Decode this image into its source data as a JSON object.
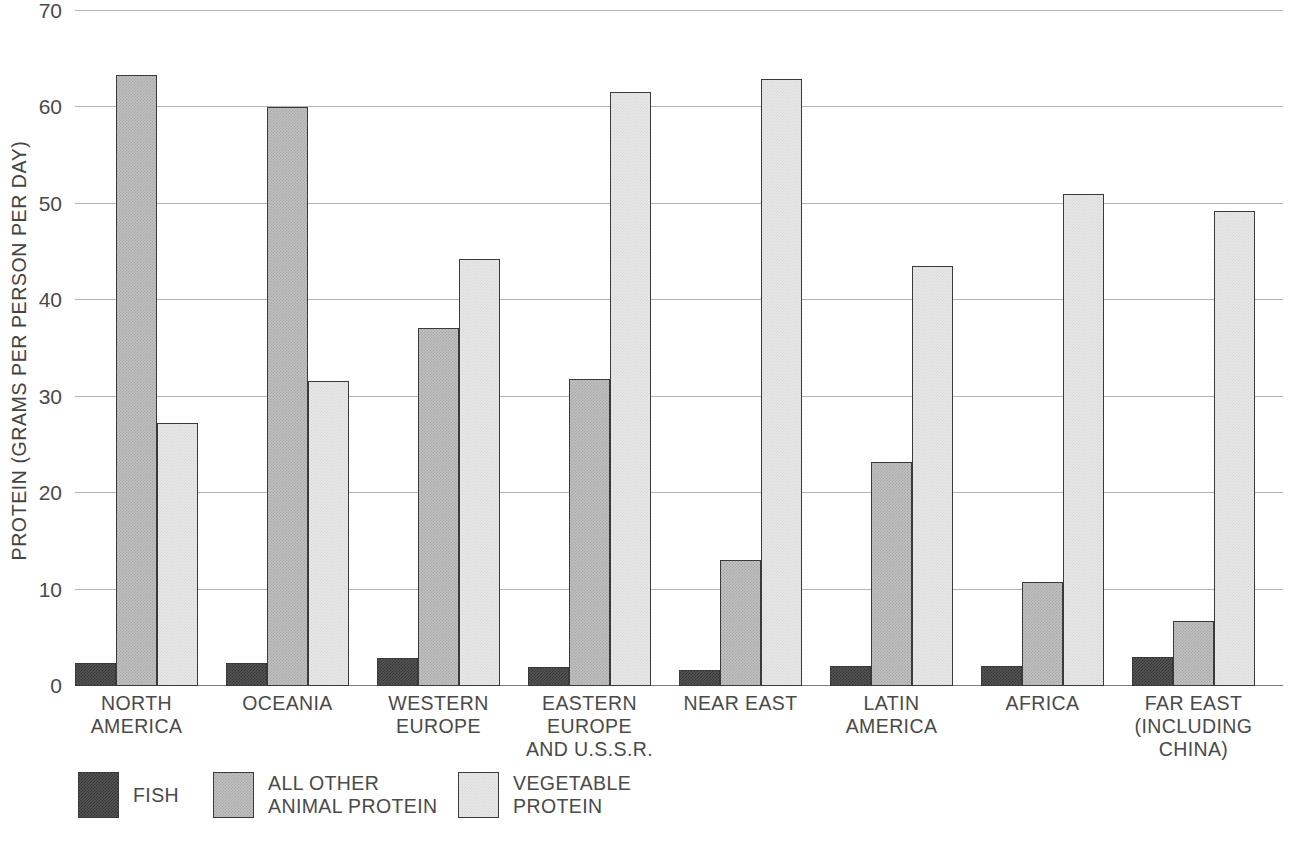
{
  "chart_data": {
    "type": "bar",
    "title": "",
    "xlabel": "",
    "ylabel": "PROTEIN (GRAMS PER PERSON PER DAY)",
    "ylim": [
      0,
      70
    ],
    "yticks": [
      0,
      10,
      20,
      30,
      40,
      50,
      60,
      70
    ],
    "ytick_labels": [
      "0",
      "10",
      "20",
      "30",
      "40",
      "50",
      "60",
      "70"
    ],
    "grid": true,
    "legend_position": "bottom-left",
    "categories": [
      "NORTH\nAMERICA",
      "OCEANIA",
      "WESTERN\nEUROPE",
      "EASTERN\nEUROPE\nAND U.S.S.R.",
      "NEAR EAST",
      "LATIN\nAMERICA",
      "AFRICA",
      "FAR EAST\n(INCLUDING\nCHINA)"
    ],
    "series": [
      {
        "name": "FISH",
        "color": "#545454",
        "values": [
          2.4,
          2.4,
          2.9,
          2.0,
          1.7,
          2.1,
          2.1,
          3.0
        ]
      },
      {
        "name": "ALL OTHER\nANIMAL PROTEIN",
        "color": "#c0c0c0",
        "values": [
          63.4,
          60.0,
          37.1,
          31.8,
          13.1,
          23.2,
          10.8,
          6.7
        ]
      },
      {
        "name": "VEGETABLE\nPROTEIN",
        "color": "#e8e8e8",
        "values": [
          27.3,
          31.6,
          44.3,
          61.6,
          63.0,
          43.6,
          51.0,
          49.3
        ]
      }
    ]
  },
  "legend": {
    "items": [
      {
        "label": "FISH",
        "swatch": "fish"
      },
      {
        "label": "ALL OTHER\nANIMAL PROTEIN",
        "swatch": "animal"
      },
      {
        "label": "VEGETABLE\nPROTEIN",
        "swatch": "vegetable"
      }
    ]
  }
}
